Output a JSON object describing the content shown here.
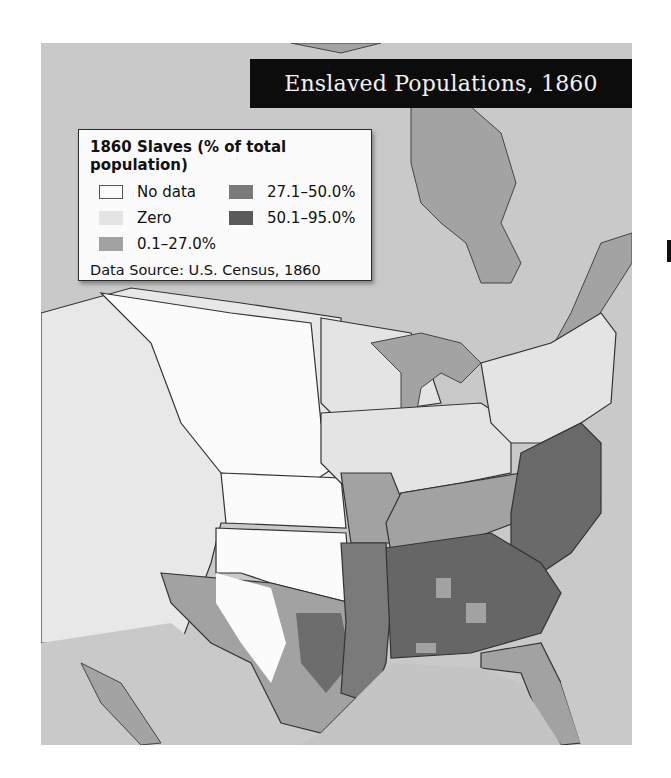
{
  "title": "Enslaved Populations, 1860",
  "legend": {
    "title": "1860 Slaves (% of total population)",
    "items": [
      {
        "label": "No data",
        "color": "#fbfbfb",
        "border": "#555555"
      },
      {
        "label": "27.1–50.0%",
        "color": "#7a7a7a",
        "border": "none"
      },
      {
        "label": "Zero",
        "color": "#e4e4e4",
        "border": "none"
      },
      {
        "label": "50.1–95.0%",
        "color": "#5a5a5a",
        "border": "none"
      },
      {
        "label": "0.1–27.0%",
        "color": "#a2a2a2",
        "border": "none"
      }
    ],
    "source": "Data Source: U.S. Census, 1860"
  },
  "colors": {
    "water": "#c9c9c9",
    "land_foreign": "#9f9f9f",
    "no_data": "#fbfbfb",
    "zero": "#e4e4e4",
    "low": "#a2a2a2",
    "mid": "#7a7a7a",
    "high": "#5a5a5a",
    "border": "#333333"
  }
}
